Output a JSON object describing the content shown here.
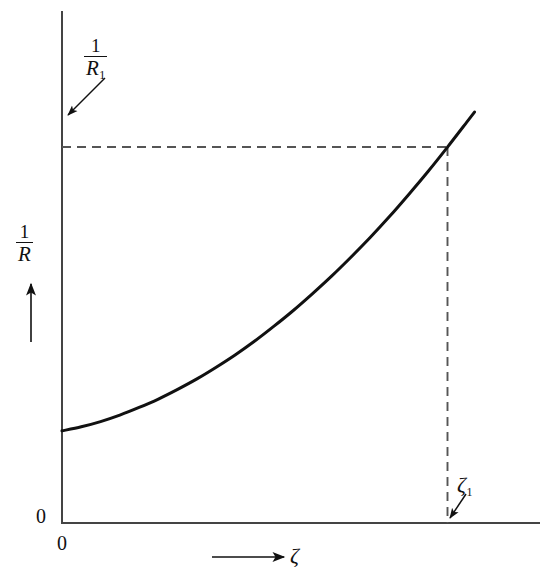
{
  "figure": {
    "background_color": "#ffffff",
    "ink_color": "#111111",
    "axis_color": "#444444",
    "curve_color": "#111111",
    "dash_color": "#555555",
    "width": 553,
    "height": 582
  },
  "labels": {
    "y_axis": {
      "name": "1/R",
      "numerator": "1",
      "denominator": "R",
      "arrow": "up-arrow"
    },
    "y_value_marker": {
      "name": "1/R_1",
      "numerator": "1",
      "denominator": "R",
      "denominator_subscript": "1",
      "arrow": "arrow-down-left"
    },
    "x_axis": {
      "symbol": "ζ",
      "arrow": "right-arrow"
    },
    "x_value_marker": {
      "symbol": "ζ",
      "subscript": "1",
      "arrow": "arrow-down-left"
    },
    "origin_left": "0",
    "origin_below": "0"
  },
  "chart_data": {
    "type": "line",
    "title": "",
    "xlabel": "ζ",
    "ylabel": "1/R",
    "grid": false,
    "legend": false,
    "xlim": [
      0,
      1.18
    ],
    "ylim": [
      0,
      1.18
    ],
    "axis_ticks": {
      "x": [
        "0"
      ],
      "y": [
        "0"
      ]
    },
    "series": [
      {
        "name": "1/R vs zeta",
        "style": "solid",
        "x": [
          0.0,
          0.05,
          0.1,
          0.15,
          0.2,
          0.25,
          0.3,
          0.35,
          0.4,
          0.45,
          0.5,
          0.55,
          0.6,
          0.65,
          0.7,
          0.75,
          0.8,
          0.85,
          0.9,
          0.95,
          1.0,
          1.05,
          1.07
        ],
        "y": [
          0.229,
          0.239,
          0.252,
          0.268,
          0.287,
          0.308,
          0.332,
          0.358,
          0.387,
          0.418,
          0.452,
          0.489,
          0.528,
          0.57,
          0.614,
          0.661,
          0.71,
          0.762,
          0.817,
          0.874,
          0.934,
          0.996,
          1.021
        ]
      }
    ],
    "annotations": [
      {
        "name": "curve-start",
        "x": 0.0,
        "y": 0.229,
        "label": ""
      },
      {
        "name": "intersection-point",
        "x": 1.0,
        "y": 0.934,
        "label": "(ζ₁, 1/R₁)"
      }
    ],
    "guide_lines": [
      {
        "name": "horizontal-dashed-to-1-over-R1",
        "orientation": "horizontal",
        "value_y": 0.934,
        "from_x": 0.0,
        "to_x": 1.0,
        "style": "dashed"
      },
      {
        "name": "vertical-dashed-to-zeta1",
        "orientation": "vertical",
        "value_x": 1.0,
        "from_y": 0.0,
        "to_y": 0.934,
        "style": "dashed"
      }
    ]
  }
}
